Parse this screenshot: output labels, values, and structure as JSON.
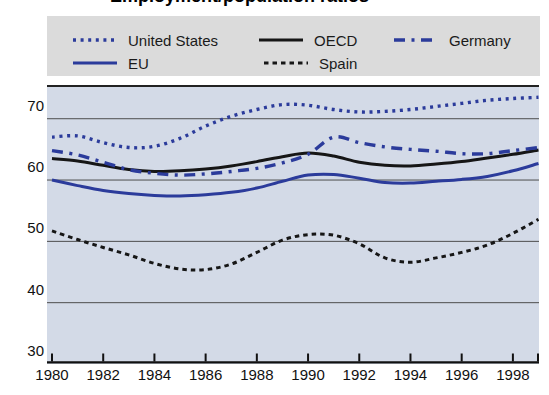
{
  "page": {
    "clipped_title": "Employment/population ratios"
  },
  "colors": {
    "line_blue": "#2b3b9b",
    "line_black": "#161616",
    "plot_background": "#d3dae7",
    "legend_background": "#dbdbdb",
    "gridline": "#4d4d4d",
    "axis": "#111111"
  },
  "chart_data": {
    "type": "line",
    "x": [
      1980,
      1981,
      1982,
      1983,
      1984,
      1985,
      1986,
      1987,
      1988,
      1989,
      1990,
      1991,
      1992,
      1993,
      1994,
      1995,
      1996,
      1997,
      1998,
      1999
    ],
    "series": [
      {
        "name": "United States",
        "color": "#2b3b9b",
        "line_style": "fine-dotted",
        "values": [
          67.0,
          67.2,
          66.1,
          65.3,
          65.5,
          66.8,
          68.8,
          70.4,
          71.5,
          72.3,
          72.2,
          71.5,
          71.1,
          71.2,
          71.5,
          72.0,
          72.5,
          73.0,
          73.3,
          73.5
        ]
      },
      {
        "name": "OECD",
        "color": "#161616",
        "line_style": "solid",
        "values": [
          63.5,
          63.1,
          62.4,
          61.7,
          61.4,
          61.5,
          61.8,
          62.3,
          63.0,
          63.8,
          64.4,
          63.9,
          62.9,
          62.4,
          62.3,
          62.6,
          63.0,
          63.6,
          64.2,
          64.9
        ]
      },
      {
        "name": "Germany",
        "color": "#2b3b9b",
        "line_style": "long-dashed",
        "values": [
          64.8,
          64.1,
          62.9,
          61.7,
          61.1,
          60.8,
          61.0,
          61.4,
          61.9,
          62.8,
          64.2,
          67.0,
          66.1,
          65.4,
          65.0,
          64.7,
          64.3,
          64.3,
          64.8,
          65.3
        ]
      },
      {
        "name": "EU",
        "color": "#2b3b9b",
        "line_style": "solid",
        "values": [
          60.0,
          59.1,
          58.3,
          57.8,
          57.5,
          57.4,
          57.6,
          58.0,
          58.7,
          59.8,
          60.8,
          60.9,
          60.3,
          59.6,
          59.5,
          59.8,
          60.1,
          60.6,
          61.5,
          62.7
        ]
      },
      {
        "name": "Spain",
        "color": "#161616",
        "line_style": "short-dotted",
        "values": [
          51.7,
          50.3,
          49.0,
          47.8,
          46.4,
          45.5,
          45.4,
          46.3,
          48.2,
          50.2,
          51.1,
          51.0,
          49.6,
          47.3,
          46.6,
          47.3,
          48.2,
          49.4,
          51.3,
          53.6
        ]
      }
    ],
    "ylim": [
      30,
      75.5
    ],
    "yticks": [
      70,
      60,
      50,
      40,
      30
    ],
    "xticks": [
      1980,
      1982,
      1984,
      1986,
      1988,
      1990,
      1992,
      1994,
      1996,
      1998
    ],
    "grid": true,
    "legend_position": "top"
  }
}
